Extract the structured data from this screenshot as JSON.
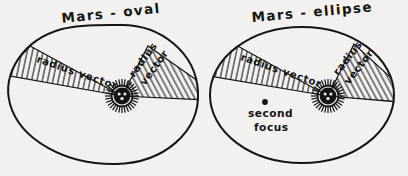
{
  "figure": {
    "background_color": "#f2f1ef",
    "ink_color": "#151515",
    "panels": [
      {
        "id": "oval",
        "title": "Mars - oval",
        "orbit_shape": "oval",
        "sun_icon": "sun-with-face-icon",
        "sectors": [
          {
            "id": "left-sector",
            "label": "radius vector",
            "label_lines": [
              "radius vector"
            ],
            "hatched": true
          },
          {
            "id": "right-sector",
            "label": "radius vector",
            "label_lines": [
              "radius",
              "vector"
            ],
            "hatched": true
          }
        ],
        "annotations": []
      },
      {
        "id": "ellipse",
        "title": "Mars - ellipse",
        "orbit_shape": "ellipse",
        "sun_icon": "sun-with-face-icon",
        "sectors": [
          {
            "id": "left-sector",
            "label": "radius vector",
            "label_lines": [
              "radius vector"
            ],
            "hatched": true
          },
          {
            "id": "right-sector",
            "label": "radius vector",
            "label_lines": [
              "radius",
              "vector"
            ],
            "hatched": true
          }
        ],
        "annotations": [
          {
            "id": "second-focus",
            "marker": "dot-marker",
            "label_lines": [
              "second",
              "focus"
            ]
          }
        ]
      }
    ]
  },
  "panel_oval": {
    "title": "Mars - oval",
    "left_vector_label": "radius vector",
    "right_vector_label_line1": "radius",
    "right_vector_label_line2": "vector"
  },
  "panel_ellipse": {
    "title": "Mars - ellipse",
    "left_vector_label": "radius vector",
    "right_vector_label_line1": "radius",
    "right_vector_label_line2": "vector",
    "second_focus_line1": "second",
    "second_focus_line2": "focus"
  }
}
